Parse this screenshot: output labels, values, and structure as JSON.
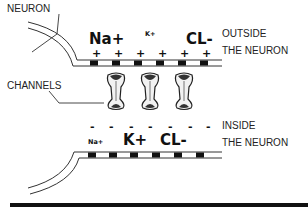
{
  "diagram": {
    "title_label": "NEURON",
    "channels_label": "CHANNELS",
    "outside": {
      "label_line1": "OUTSIDE",
      "label_line2": "THE NEURON",
      "ions": [
        {
          "name": "Na+",
          "size": "large"
        },
        {
          "name": "K+",
          "size": "small"
        },
        {
          "name": "CL-",
          "size": "large"
        }
      ],
      "charge_symbol": "+",
      "charge_count": 6
    },
    "inside": {
      "label_line1": "INSIDE",
      "label_line2": "THE NEURON",
      "ions": [
        {
          "name": "Na+",
          "size": "small"
        },
        {
          "name": "K+",
          "size": "large"
        },
        {
          "name": "CL-",
          "size": "large"
        }
      ],
      "charge_symbol": "-",
      "charge_count": 7
    },
    "channel_count": 3,
    "colors": {
      "ink": "#111111",
      "membrane": "#333333",
      "channel_fill": "#f2f2f2",
      "background": "#ffffff"
    }
  }
}
